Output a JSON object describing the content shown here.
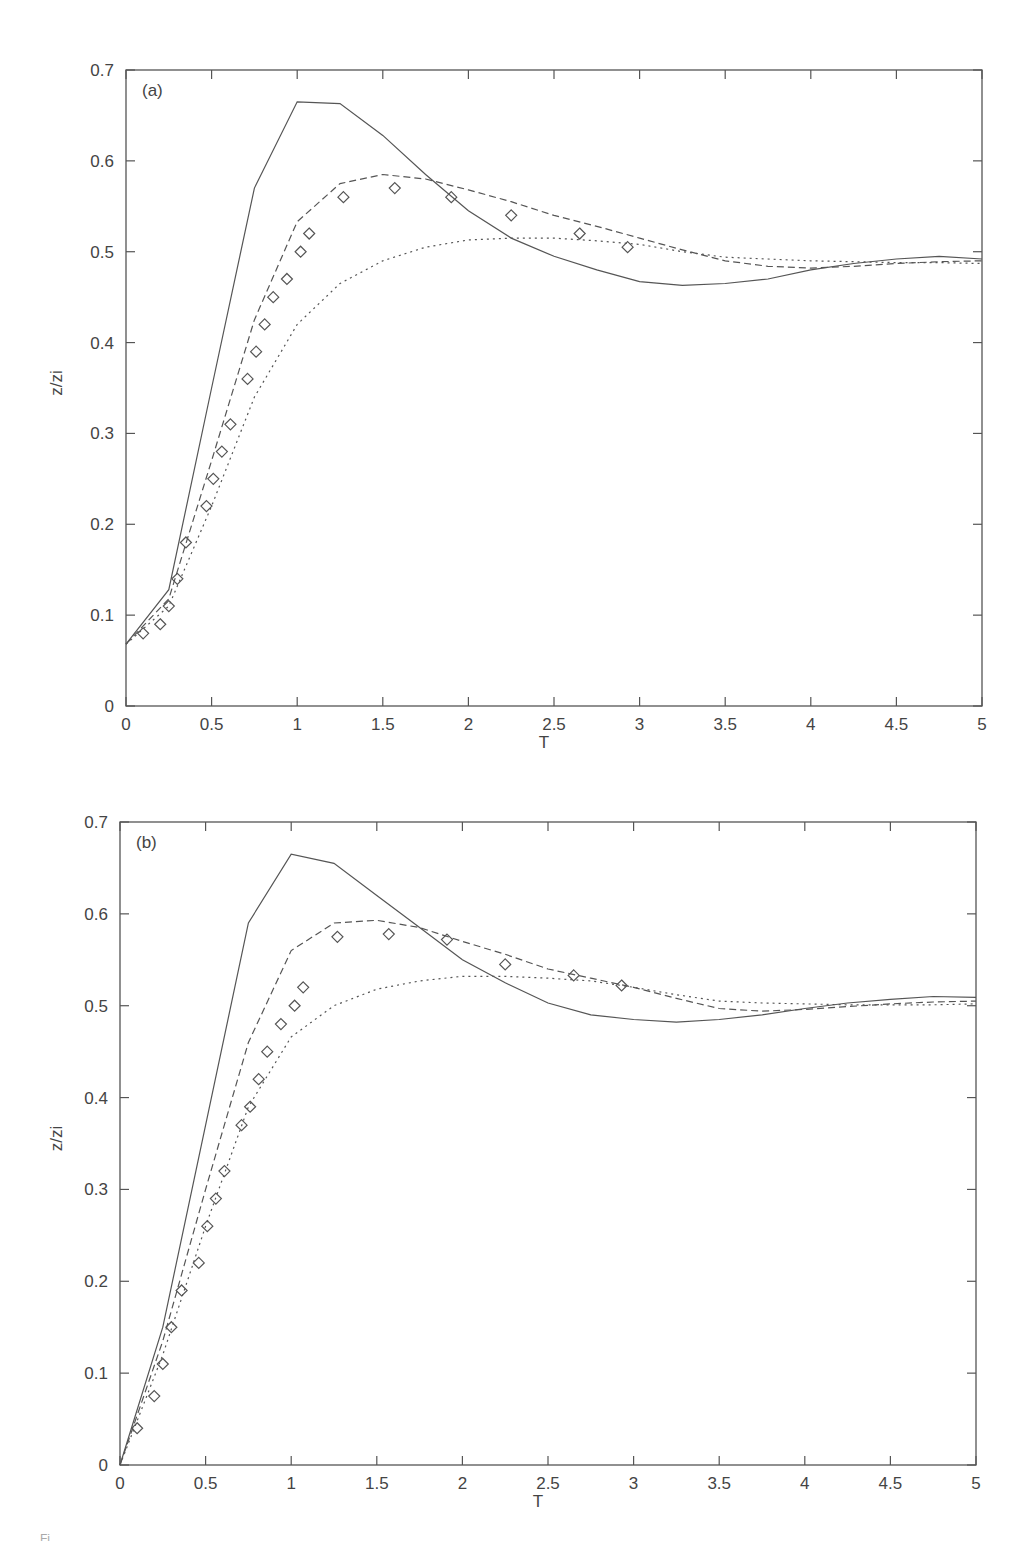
{
  "figure": {
    "caption_fragment": "Fi"
  },
  "chart_data": [
    {
      "id": "a",
      "type": "line",
      "panel_label": "(a)",
      "title": "",
      "xlabel": "T",
      "ylabel": "z/zi",
      "xlim": [
        0,
        5
      ],
      "ylim": [
        0,
        0.7
      ],
      "xticks": [
        0,
        0.5,
        1,
        1.5,
        2,
        2.5,
        3,
        3.5,
        4,
        4.5,
        5
      ],
      "xtick_labels": [
        "0",
        "0.5",
        "1",
        "1.5",
        "2",
        "2.5",
        "3",
        "3.5",
        "4",
        "4.5",
        "5"
      ],
      "yticks": [
        0,
        0.1,
        0.2,
        0.3,
        0.4,
        0.5,
        0.6,
        0.7
      ],
      "ytick_labels": [
        "0",
        "0.1",
        "0.2",
        "0.3",
        "0.4",
        "0.5",
        "0.6",
        "0.7"
      ],
      "grid": false,
      "legend": null,
      "frame_px": {
        "left": 126,
        "right": 982,
        "top": 70,
        "bottom": 706
      },
      "series": [
        {
          "name": "solid",
          "style": "solid",
          "x": [
            0,
            0.25,
            0.5,
            0.75,
            1.0,
            1.25,
            1.5,
            1.75,
            2.0,
            2.25,
            2.5,
            2.75,
            3.0,
            3.25,
            3.5,
            3.75,
            4.0,
            4.25,
            4.5,
            4.75,
            5.0
          ],
          "y": [
            0.068,
            0.128,
            0.35,
            0.57,
            0.665,
            0.663,
            0.628,
            0.585,
            0.545,
            0.515,
            0.495,
            0.48,
            0.467,
            0.463,
            0.465,
            0.47,
            0.48,
            0.487,
            0.492,
            0.495,
            0.492
          ]
        },
        {
          "name": "dashed",
          "style": "dashed",
          "x": [
            0,
            0.25,
            0.5,
            0.75,
            1.0,
            1.25,
            1.5,
            1.75,
            2.0,
            2.25,
            2.5,
            2.75,
            3.0,
            3.25,
            3.5,
            3.75,
            4.0,
            4.25,
            4.5,
            4.75,
            5.0
          ],
          "y": [
            0.068,
            0.118,
            0.27,
            0.425,
            0.533,
            0.575,
            0.585,
            0.58,
            0.568,
            0.555,
            0.54,
            0.528,
            0.515,
            0.502,
            0.49,
            0.484,
            0.482,
            0.484,
            0.487,
            0.489,
            0.49
          ]
        },
        {
          "name": "dotted",
          "style": "dotted",
          "x": [
            0,
            0.25,
            0.5,
            0.75,
            1.0,
            1.25,
            1.5,
            1.75,
            2.0,
            2.25,
            2.5,
            2.75,
            3.0,
            3.25,
            3.5,
            3.75,
            4.0,
            4.25,
            4.5,
            4.75,
            5.0
          ],
          "y": [
            0.068,
            0.11,
            0.22,
            0.34,
            0.42,
            0.465,
            0.49,
            0.505,
            0.513,
            0.515,
            0.515,
            0.512,
            0.508,
            0.5,
            0.494,
            0.492,
            0.49,
            0.489,
            0.488,
            0.488,
            0.487
          ]
        },
        {
          "name": "diamonds",
          "style": "markers",
          "x": [
            0.1,
            0.2,
            0.25,
            0.3,
            0.35,
            0.47,
            0.51,
            0.56,
            0.61,
            0.71,
            0.76,
            0.81,
            0.86,
            0.94,
            1.02,
            1.07,
            1.27,
            1.57,
            1.9,
            2.25,
            2.65,
            2.93
          ],
          "y": [
            0.08,
            0.09,
            0.11,
            0.14,
            0.18,
            0.22,
            0.25,
            0.28,
            0.31,
            0.36,
            0.39,
            0.42,
            0.45,
            0.47,
            0.5,
            0.52,
            0.56,
            0.57,
            0.56,
            0.54,
            0.52,
            0.505
          ]
        }
      ]
    },
    {
      "id": "b",
      "type": "line",
      "panel_label": "(b)",
      "title": "",
      "xlabel": "T",
      "ylabel": "z/zi",
      "xlim": [
        0,
        5
      ],
      "ylim": [
        0,
        0.7
      ],
      "xticks": [
        0,
        0.5,
        1,
        1.5,
        2,
        2.5,
        3,
        3.5,
        4,
        4.5,
        5
      ],
      "xtick_labels": [
        "0",
        "0.5",
        "1",
        "1.5",
        "2",
        "2.5",
        "3",
        "3.5",
        "4",
        "4.5",
        "5"
      ],
      "yticks": [
        0,
        0.1,
        0.2,
        0.3,
        0.4,
        0.5,
        0.6,
        0.7
      ],
      "ytick_labels": [
        "0",
        "0.1",
        "0.2",
        "0.3",
        "0.4",
        "0.5",
        "0.6",
        "0.7"
      ],
      "grid": false,
      "legend": null,
      "frame_px": {
        "left": 120,
        "right": 976,
        "top": 822,
        "bottom": 1465
      },
      "series": [
        {
          "name": "solid",
          "style": "solid",
          "x": [
            0,
            0.25,
            0.5,
            0.75,
            1.0,
            1.25,
            1.5,
            1.75,
            2.0,
            2.25,
            2.5,
            2.75,
            3.0,
            3.25,
            3.5,
            3.75,
            4.0,
            4.25,
            4.5,
            4.75,
            5.0
          ],
          "y": [
            0.0,
            0.15,
            0.37,
            0.59,
            0.665,
            0.655,
            0.62,
            0.585,
            0.55,
            0.525,
            0.503,
            0.49,
            0.485,
            0.482,
            0.485,
            0.49,
            0.497,
            0.503,
            0.507,
            0.51,
            0.509
          ]
        },
        {
          "name": "dashed",
          "style": "dashed",
          "x": [
            0,
            0.25,
            0.5,
            0.75,
            1.0,
            1.25,
            1.5,
            1.75,
            2.0,
            2.25,
            2.5,
            2.75,
            3.0,
            3.25,
            3.5,
            3.75,
            4.0,
            4.25,
            4.5,
            4.75,
            5.0
          ],
          "y": [
            0.0,
            0.135,
            0.3,
            0.46,
            0.56,
            0.59,
            0.593,
            0.585,
            0.57,
            0.556,
            0.54,
            0.53,
            0.52,
            0.508,
            0.497,
            0.494,
            0.496,
            0.499,
            0.502,
            0.504,
            0.505
          ]
        },
        {
          "name": "dotted",
          "style": "dotted",
          "x": [
            0,
            0.25,
            0.5,
            0.75,
            1.0,
            1.25,
            1.5,
            1.75,
            2.0,
            2.25,
            2.5,
            2.75,
            3.0,
            3.25,
            3.5,
            3.75,
            4.0,
            4.25,
            4.5,
            4.75,
            5.0
          ],
          "y": [
            0.0,
            0.12,
            0.26,
            0.39,
            0.466,
            0.5,
            0.518,
            0.527,
            0.532,
            0.532,
            0.53,
            0.527,
            0.52,
            0.512,
            0.505,
            0.503,
            0.502,
            0.501,
            0.501,
            0.501,
            0.502
          ]
        },
        {
          "name": "diamonds",
          "style": "markers",
          "x": [
            0.1,
            0.2,
            0.25,
            0.3,
            0.36,
            0.46,
            0.51,
            0.56,
            0.61,
            0.71,
            0.76,
            0.81,
            0.86,
            0.94,
            1.02,
            1.07,
            1.27,
            1.57,
            1.91,
            2.25,
            2.65,
            2.93
          ],
          "y": [
            0.04,
            0.075,
            0.11,
            0.15,
            0.19,
            0.22,
            0.26,
            0.29,
            0.32,
            0.37,
            0.39,
            0.42,
            0.45,
            0.48,
            0.5,
            0.52,
            0.575,
            0.578,
            0.572,
            0.545,
            0.533,
            0.522
          ]
        }
      ]
    }
  ]
}
